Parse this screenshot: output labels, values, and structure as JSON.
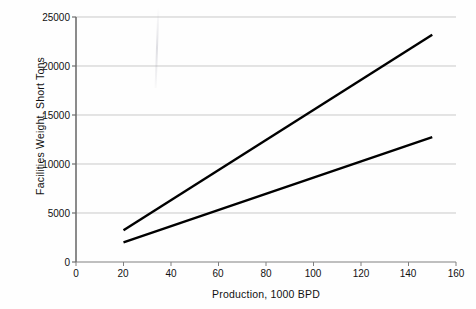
{
  "chart_data": {
    "type": "line",
    "title": "",
    "xlabel": "Production, 1000 BPD",
    "ylabel": "Facilities Weight, Short Tons",
    "xlim": [
      0,
      160
    ],
    "ylim": [
      0,
      25000
    ],
    "xticks": [
      0,
      20,
      40,
      60,
      80,
      100,
      120,
      140,
      160
    ],
    "xtick_labels": [
      "0",
      "20",
      "40",
      "60",
      "80",
      "100",
      "120",
      "140",
      "160"
    ],
    "yticks": [
      0,
      5000,
      10000,
      15000,
      20000,
      25000
    ],
    "ytick_labels": [
      "0",
      "5000",
      "10000",
      "15000",
      "20000",
      "25000"
    ],
    "grid": "horizontal",
    "legend": "none",
    "series": [
      {
        "name": "upper-line",
        "color": "#000000",
        "x": [
          20,
          150
        ],
        "values": [
          3250,
          23200
        ]
      },
      {
        "name": "lower-line",
        "color": "#000000",
        "x": [
          20,
          150
        ],
        "values": [
          2000,
          12750
        ]
      }
    ]
  },
  "axes": {
    "x_title": "Production, 1000 BPD",
    "y_title": "Facilities Weight, Short Tons",
    "x_tick_labels": [
      "0",
      "20",
      "40",
      "60",
      "80",
      "100",
      "120",
      "140",
      "160"
    ],
    "y_tick_labels": [
      "0",
      "5000",
      "10000",
      "15000",
      "20000",
      "25000"
    ]
  },
  "colors": {
    "series": "#000000",
    "gridline": "#c9c9c9",
    "axis": "#808080",
    "text": "#111111",
    "background": "#fefefe"
  }
}
